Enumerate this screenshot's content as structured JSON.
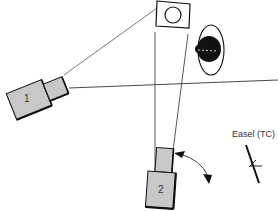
{
  "diagram": {
    "cameras": [
      {
        "id": "camera-1",
        "label": "1"
      },
      {
        "id": "camera-2",
        "label": "2"
      }
    ],
    "easel": {
      "label": "Easel (TC)"
    },
    "subjects": [
      {
        "id": "framed-picture",
        "description": "rectangle with circle"
      },
      {
        "id": "subject-figure",
        "description": "dark rounded figure in ellipse"
      }
    ],
    "colors": {
      "camera_fill": "#c8c8c8",
      "stroke": "#111111",
      "line": "#444444",
      "background": "#ffffff"
    }
  }
}
